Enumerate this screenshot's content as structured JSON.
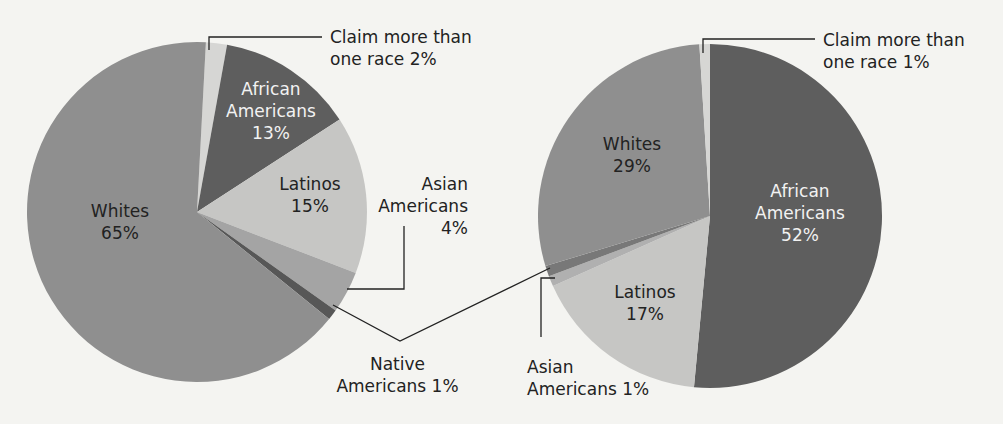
{
  "chart_data": [
    {
      "type": "pie",
      "title": "",
      "categories": [
        "Claim more than one race",
        "African Americans",
        "Latinos",
        "Asian Americans",
        "Native Americans",
        "Whites"
      ],
      "values": [
        2,
        13,
        15,
        4,
        1,
        65
      ],
      "unit": "%",
      "colors": [
        "#d6d6d4",
        "#5e5e5e",
        "#c6c6c4",
        "#a4a4a4",
        "#575757",
        "#8f8f8f"
      ],
      "start_angle_deg": 3,
      "direction": "clockwise",
      "labels": {
        "claim": {
          "line1": "Claim more than",
          "line2": "one race 2%"
        },
        "african": {
          "line1": "African",
          "line2": "Americans",
          "line3": "13%"
        },
        "latinos": {
          "line1": "Latinos",
          "line2": "15%"
        },
        "asian": {
          "line1": "Asian",
          "line2": "Americans",
          "line3": "4%"
        },
        "native": {
          "line1": "Native",
          "line2": "Americans 1%"
        },
        "whites": {
          "line1": "Whites",
          "line2": "65%"
        }
      }
    },
    {
      "type": "pie",
      "title": "",
      "categories": [
        "African Americans",
        "Latinos",
        "Asian Americans",
        "Native Americans",
        "Whites",
        "Claim more than one race"
      ],
      "values": [
        52,
        17,
        1,
        1,
        29,
        1
      ],
      "unit": "%",
      "colors": [
        "#5e5e5e",
        "#c6c6c4",
        "#b0b0b0",
        "#787878",
        "#8f8f8f",
        "#d6d6d4"
      ],
      "start_angle_deg": 0,
      "direction": "clockwise",
      "labels": {
        "claim": {
          "line1": "Claim more than",
          "line2": "one race 1%"
        },
        "african": {
          "line1": "African",
          "line2": "Americans",
          "line3": "52%"
        },
        "latinos": {
          "line1": "Latinos",
          "line2": "17%"
        },
        "asian": {
          "line1": "Asian",
          "line2": "Americans 1%"
        },
        "whites": {
          "line1": "Whites",
          "line2": "29%"
        }
      }
    }
  ]
}
